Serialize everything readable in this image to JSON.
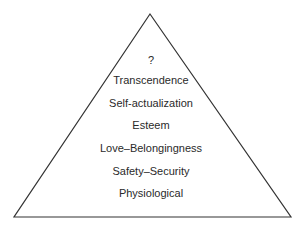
{
  "diagram": {
    "type": "pyramid",
    "colors": {
      "background": "#ffffff",
      "outline": "#333333",
      "text": "#2a2a2a"
    },
    "levels": [
      {
        "label": "?"
      },
      {
        "label": "Transcendence"
      },
      {
        "label": "Self-actualization"
      },
      {
        "label": "Esteem"
      },
      {
        "label": "Love–Belongingness"
      },
      {
        "label": "Safety–Security"
      },
      {
        "label": "Physiological"
      }
    ]
  }
}
